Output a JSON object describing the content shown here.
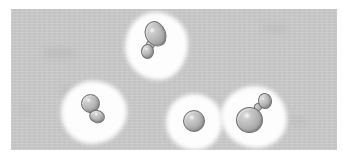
{
  "figure": {
    "title": "Budding yeast cells micrograph",
    "modality": "brightfield-microscopy",
    "rendering": "grayscale",
    "canvas": {
      "image_width_px": 343,
      "image_height_px": 158,
      "plate_left_px": 11,
      "plate_top_px": 9,
      "plate_width_px": 326,
      "plate_height_px": 141
    },
    "colors": {
      "page_background": "#ffffff",
      "plate_background": "#c9c9c9",
      "halo": "#fdfdfd",
      "cell_outline": "#6f6f6f",
      "cell_highlight": "#d9d9d9",
      "cell_shadow": "#8e8e8e"
    },
    "object_count_label": "4",
    "objects": [
      {
        "id": "cell-cluster-1",
        "label": "elongated mother cell with small distal bud",
        "stage": "late-budding",
        "halo": {
          "left": 125,
          "top": 12,
          "width": 63,
          "height": 68,
          "radius": "48% 52% 46% 54% / 52% 46% 54% 48%"
        },
        "mother": {
          "left": 145,
          "top": 21,
          "width": 21,
          "height": 26,
          "radius": "52% 48% 42% 58% / 46% 54% 46% 54%",
          "rotate": -18
        },
        "bud": {
          "left": 141,
          "top": 44,
          "width": 13,
          "height": 15,
          "radius": "50%",
          "rotate": 0
        },
        "neck": {
          "left": 146,
          "top": 40,
          "width": 9,
          "height": 9,
          "rotate": -30
        }
      },
      {
        "id": "cell-cluster-2",
        "label": "round mother cell with attached daughter bud",
        "stage": "mid-budding",
        "halo": {
          "left": 61,
          "top": 81,
          "width": 66,
          "height": 63,
          "radius": "48% 52% 54% 46% / 50% 48% 52% 50%"
        },
        "mother": {
          "left": 81,
          "top": 94,
          "width": 19,
          "height": 19,
          "radius": "50%",
          "rotate": 0
        },
        "bud": {
          "left": 89,
          "top": 110,
          "width": 16,
          "height": 13,
          "radius": "52% 48% 50% 50%",
          "rotate": 20
        },
        "neck": {
          "left": 88,
          "top": 107,
          "width": 8,
          "height": 7,
          "rotate": 25
        }
      },
      {
        "id": "cell-cluster-3",
        "label": "single unbudded round cell",
        "stage": "unbudded",
        "halo": {
          "left": 166,
          "top": 94,
          "width": 56,
          "height": 56,
          "radius": "50% 50% 48% 52% / 52% 48% 50% 50%"
        },
        "mother": {
          "left": 183,
          "top": 110,
          "width": 22,
          "height": 22,
          "radius": "50%",
          "rotate": 0
        },
        "bud": null,
        "neck": null
      },
      {
        "id": "cell-cluster-4",
        "label": "large mother cell with small apical bud",
        "stage": "early-budding",
        "halo": {
          "left": 221,
          "top": 86,
          "width": 66,
          "height": 62,
          "radius": "52% 48% 46% 54% / 48% 54% 46% 52%"
        },
        "mother": {
          "left": 236,
          "top": 107,
          "width": 27,
          "height": 26,
          "radius": "50%",
          "rotate": 0
        },
        "bud": {
          "left": 258,
          "top": 93,
          "width": 14,
          "height": 16,
          "radius": "50%",
          "rotate": -10
        },
        "neck": {
          "left": 254,
          "top": 103,
          "width": 8,
          "height": 8,
          "rotate": -35
        }
      }
    ],
    "background_smudges": [
      {
        "left": 42,
        "top": 47,
        "width": 34,
        "height": 12
      },
      {
        "left": 60,
        "top": 86,
        "width": 14,
        "height": 8
      },
      {
        "left": 20,
        "top": 106,
        "width": 9,
        "height": 6
      },
      {
        "left": 262,
        "top": 24,
        "width": 26,
        "height": 9
      },
      {
        "left": 287,
        "top": 118,
        "width": 20,
        "height": 7
      }
    ]
  }
}
